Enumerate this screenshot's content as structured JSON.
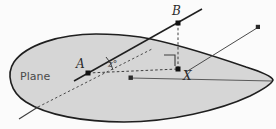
{
  "figure": {
    "surface_label": "Plane",
    "labels": {
      "point_a": "A",
      "point_b": "B",
      "point_x": "X",
      "angle": "z°"
    },
    "colors": {
      "plane_fill": "#d6d6d6",
      "plane_stroke": "#1f1f1f",
      "line_stroke": "#3c3c3c",
      "dashed_stroke": "#4a4a4a",
      "text": "#2b2b2b",
      "background": "#fbfbfb"
    },
    "geometry": {
      "plane_outline_path": "M 96 34 C 60 34 26 45 14 62 C 6 74 10 92 26 102 C 46 115 84 122 124 122 C 170 122 220 110 250 96 C 264 89 272 83 273 80 C 272 77 262 72 246 67 C 214 56 170 42 140 37 C 126 35 110 34 96 34 Z",
      "points": [
        {
          "name": "A",
          "x": 88,
          "y": 73
        },
        {
          "name": "B",
          "x": 178,
          "y": 23
        },
        {
          "name": "X",
          "x": 178,
          "y": 69
        },
        {
          "name": "mid-plane-node",
          "x": 131,
          "y": 78
        },
        {
          "name": "far-right-node",
          "x": 258,
          "y": 27
        }
      ],
      "segments": [
        {
          "name": "ray-A-to-B-beyond",
          "kind": "solid",
          "x1": 76,
          "y1": 80,
          "x2": 200,
          "y2": 10
        },
        {
          "name": "segment-A-to-X",
          "kind": "dashed",
          "x1": 88,
          "y1": 73,
          "x2": 178,
          "y2": 69
        },
        {
          "name": "segment-B-to-X",
          "kind": "dashed",
          "x1": 178,
          "y1": 23,
          "x2": 178,
          "y2": 69
        },
        {
          "name": "line-X-to-far-right",
          "kind": "solid",
          "x1": 185,
          "y1": 72,
          "x2": 258,
          "y2": 27
        },
        {
          "name": "line-mid-node-to-rim",
          "kind": "solid",
          "x1": 131,
          "y1": 78,
          "x2": 272,
          "y2": 81
        },
        {
          "name": "dashed-trace-through-plane",
          "kind": "dashed",
          "x1": 38,
          "y1": 107,
          "x2": 152,
          "y2": 49
        },
        {
          "name": "solid-tail-lower-left",
          "kind": "solid",
          "x1": 38,
          "y1": 107,
          "x2": 19,
          "y2": 119
        }
      ],
      "markers": {
        "angle_arc": {
          "name": "angle-arc-at-A",
          "cx": 88,
          "cy": 73,
          "radius": 26
        },
        "right_angle": {
          "name": "right-angle-marker-at-X",
          "x": 164,
          "y": 55,
          "size": 11
        }
      }
    }
  }
}
